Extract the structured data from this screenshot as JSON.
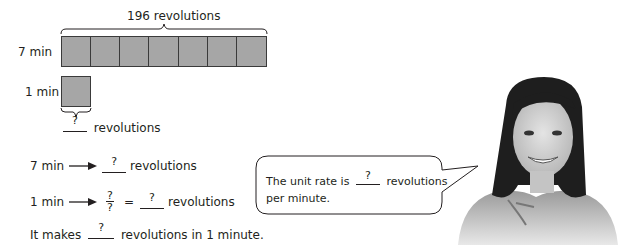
{
  "diagram": {
    "total_label": "196 revolutions",
    "row1_label": "7 min",
    "row1_cells": 7,
    "row2_label": "1 min",
    "row2_cells": 1,
    "unknown_mark": "?",
    "unknown_unit": "revolutions",
    "bar_fill": "#a6a6a6"
  },
  "steps": [
    {
      "left": "7 min",
      "answer": "?",
      "unit": "revolutions"
    },
    {
      "left": "1 min",
      "frac_num": "?",
      "frac_den": "?",
      "equals": "=",
      "answer": "?",
      "unit": "revolutions"
    }
  ],
  "conclusion": {
    "prefix": "It makes",
    "answer": "?",
    "suffix": "revolutions in 1 minute."
  },
  "speech_bubble": {
    "line1_prefix": "The unit rate is",
    "answer": "?",
    "line1_suffix": "revolutions",
    "line2": "per minute."
  },
  "photo": {
    "description": "smiling-girl-photo"
  }
}
